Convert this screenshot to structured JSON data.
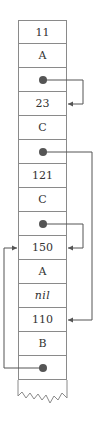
{
  "diagram": {
    "title": "",
    "cells": [
      {
        "label": "11",
        "type": "value"
      },
      {
        "label": "A",
        "type": "value"
      },
      {
        "label": "",
        "type": "pointer"
      },
      {
        "label": "23",
        "type": "value"
      },
      {
        "label": "C",
        "type": "value"
      },
      {
        "label": "",
        "type": "pointer"
      },
      {
        "label": "121",
        "type": "value"
      },
      {
        "label": "C",
        "type": "value"
      },
      {
        "label": "",
        "type": "pointer"
      },
      {
        "label": "150",
        "type": "value"
      },
      {
        "label": "A",
        "type": "value"
      },
      {
        "label": "nil",
        "type": "italic"
      },
      {
        "label": "110",
        "type": "value"
      },
      {
        "label": "B",
        "type": "value"
      },
      {
        "label": "",
        "type": "pointer"
      }
    ],
    "pointers": [
      {
        "from_cell": 2,
        "to_cell": 3,
        "side": "right",
        "x": 83
      },
      {
        "from_cell": 5,
        "to_cell": 12,
        "side": "right",
        "x": 92
      },
      {
        "from_cell": 8,
        "to_cell": 9,
        "side": "right",
        "x": 83
      },
      {
        "from_cell": 14,
        "to_cell": 9,
        "side": "left",
        "x": 4
      }
    ],
    "colors": {
      "border": "#8a8a8a",
      "line": "#555555",
      "text": "#333333"
    }
  }
}
